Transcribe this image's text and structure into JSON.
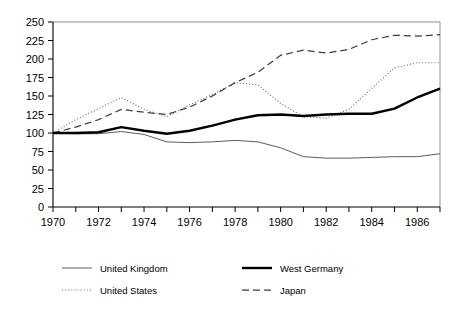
{
  "chart_data": {
    "type": "line",
    "title": "",
    "subtitle": "",
    "xlabel": "",
    "ylabel": "",
    "xlim": [
      1970,
      1987
    ],
    "ylim": [
      0,
      250
    ],
    "grid": false,
    "legend_position": "bottom",
    "x": [
      1970,
      1971,
      1972,
      1973,
      1974,
      1975,
      1976,
      1977,
      1978,
      1979,
      1980,
      1981,
      1982,
      1983,
      1984,
      1985,
      1986,
      1987
    ],
    "y_ticks": [
      0,
      25,
      50,
      75,
      100,
      125,
      150,
      175,
      200,
      225,
      250
    ],
    "y_tick_labels": [
      "0",
      "25",
      "50",
      "75",
      "100",
      "125",
      "150",
      "175",
      "200",
      "225",
      "250"
    ],
    "x_ticks": [
      1970,
      1971,
      1972,
      1973,
      1974,
      1975,
      1976,
      1977,
      1978,
      1979,
      1980,
      1981,
      1982,
      1983,
      1984,
      1985,
      1986,
      1987
    ],
    "x_tick_labels_shown": [
      "1970",
      "1972",
      "1974",
      "1976",
      "1978",
      "1980",
      "1982",
      "1984",
      "1986"
    ],
    "series": [
      {
        "name": "United Kingdom",
        "style": "thin-solid",
        "color": "#5b5b5b",
        "values": [
          100,
          99,
          99,
          102,
          98,
          88,
          87,
          88,
          90,
          88,
          80,
          68,
          66,
          66,
          67,
          68,
          68,
          72
        ]
      },
      {
        "name": "United States",
        "style": "dotted",
        "color": "#6e6e6e",
        "values": [
          100,
          118,
          133,
          148,
          132,
          122,
          138,
          152,
          168,
          165,
          140,
          122,
          120,
          132,
          160,
          188,
          195,
          195
        ]
      },
      {
        "name": "West Germany",
        "style": "thick-solid",
        "color": "#000000",
        "values": [
          100,
          100,
          101,
          108,
          103,
          99,
          103,
          110,
          118,
          124,
          125,
          123,
          125,
          126,
          126,
          133,
          148,
          160
        ]
      },
      {
        "name": "Japan",
        "style": "dashed",
        "color": "#3c3c3c",
        "values": [
          100,
          108,
          118,
          132,
          128,
          125,
          135,
          150,
          168,
          182,
          205,
          212,
          208,
          213,
          226,
          232,
          231,
          233
        ]
      }
    ]
  },
  "legend": {
    "items": [
      {
        "label": "United Kingdom",
        "key": "uk"
      },
      {
        "label": "West Germany",
        "key": "wg"
      },
      {
        "label": "United States",
        "key": "us"
      },
      {
        "label": "Japan",
        "key": "jp"
      }
    ]
  },
  "axes": {
    "y_axis_name": "value-axis",
    "x_axis_name": "year-axis"
  }
}
